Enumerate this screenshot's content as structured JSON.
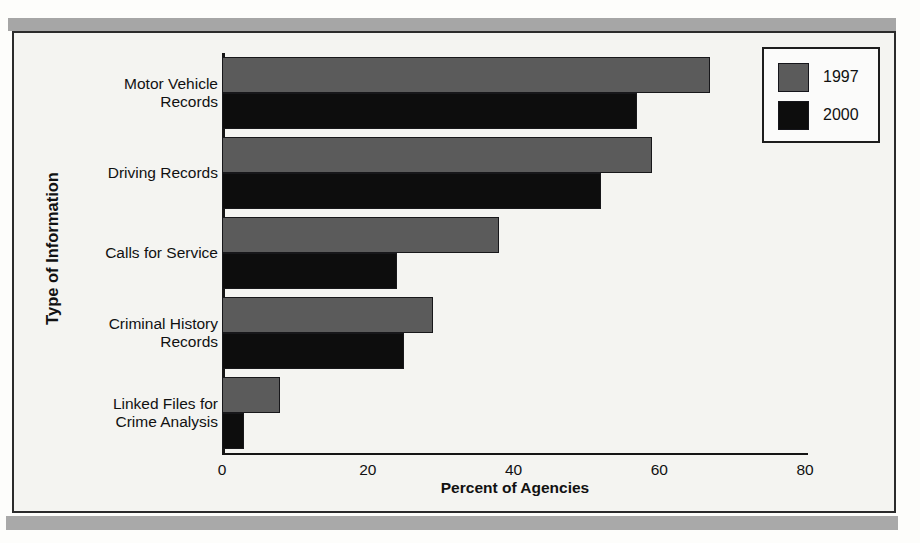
{
  "chart_data": {
    "type": "bar",
    "orientation": "horizontal",
    "title": "",
    "xlabel": "Percent of Agencies",
    "ylabel": "Type of Information",
    "xlim": [
      0,
      80
    ],
    "xticks": [
      "0",
      "20",
      "40",
      "60",
      "80"
    ],
    "grid": false,
    "legend_position": "top-right",
    "categories": [
      "Motor Vehicle Records",
      "Driving Records",
      "Calls for Service",
      "Criminal History Records",
      "Linked Files for Crime Analysis"
    ],
    "category_lines": [
      [
        "Motor Vehicle",
        "Records"
      ],
      [
        "Driving Records"
      ],
      [
        "Calls for Service"
      ],
      [
        "Criminal History",
        "Records"
      ],
      [
        "Linked Files for",
        "Crime Analysis"
      ]
    ],
    "series": [
      {
        "name": "1997",
        "color": "#5b5b5b",
        "values": [
          67,
          59,
          38,
          29,
          8
        ]
      },
      {
        "name": "2000",
        "color": "#0d0d0d",
        "values": [
          57,
          52,
          24,
          25,
          3
        ]
      }
    ]
  },
  "legend": {
    "entries": [
      {
        "label": "1997",
        "color": "#5b5b5b"
      },
      {
        "label": "2000",
        "color": "#0d0d0d"
      }
    ]
  }
}
